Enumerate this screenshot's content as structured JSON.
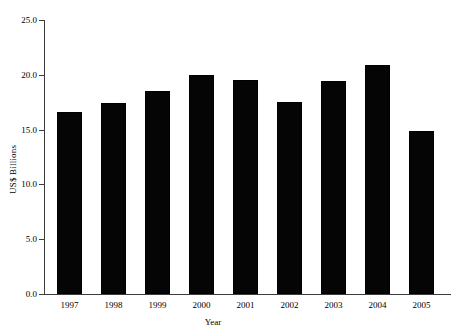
{
  "chart_data": {
    "type": "bar",
    "title": "",
    "subtitle": "",
    "xlabel": "Year",
    "ylabel": "US$ Billions",
    "categories": [
      "1997",
      "1998",
      "1999",
      "2000",
      "2001",
      "2002",
      "2003",
      "2004",
      "2005"
    ],
    "values": [
      16.6,
      17.4,
      18.5,
      20.0,
      19.5,
      17.5,
      19.4,
      20.9,
      14.9
    ],
    "ylim": [
      0.0,
      25.0
    ],
    "yticks": [
      "0.0",
      "5.0",
      "10.0",
      "15.0",
      "20.0",
      "25.0"
    ],
    "ytick_values": [
      0.0,
      5.0,
      10.0,
      15.0,
      20.0,
      25.0
    ],
    "grid": false,
    "legend": null,
    "bar_color": "#050505",
    "axis_color": "#3d3d3d",
    "background": "#ffffff"
  }
}
